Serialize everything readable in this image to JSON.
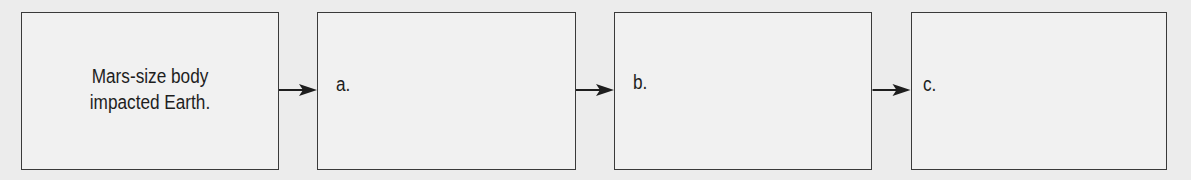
{
  "diagram": {
    "type": "flowchart",
    "direction": "left-to-right",
    "boxes": [
      {
        "id": "start",
        "text_line1": "Mars-size body",
        "text_line2": "impacted Earth."
      },
      {
        "id": "a",
        "text": "a."
      },
      {
        "id": "b",
        "text": "b."
      },
      {
        "id": "c",
        "text": "c."
      }
    ],
    "arrows": [
      {
        "from": "start",
        "to": "a"
      },
      {
        "from": "a",
        "to": "b"
      },
      {
        "from": "b",
        "to": "c"
      }
    ],
    "colors": {
      "border": "#3a3a3a",
      "text": "#1e1e1e",
      "background": "#ececec"
    }
  }
}
